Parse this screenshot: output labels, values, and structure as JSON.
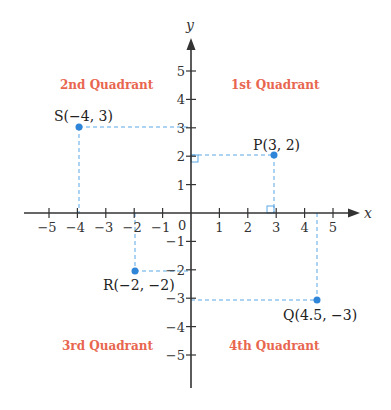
{
  "chart_data": {
    "type": "scatter",
    "title": "",
    "xlabel": "x",
    "ylabel": "y",
    "xlim": [
      -5.5,
      5.5
    ],
    "ylim": [
      -5.5,
      5.5
    ],
    "origin_label": "0",
    "x_ticks": [
      "−5",
      "−4",
      "−3",
      "−2",
      "−1",
      "1",
      "2",
      "3",
      "4",
      "5"
    ],
    "y_ticks": [
      "5",
      "4",
      "3",
      "2",
      "1",
      "−1",
      "−2",
      "−3",
      "−4",
      "−5"
    ],
    "points": [
      {
        "name": "S",
        "x": -4,
        "y": 3,
        "label": "S(−4, 3)"
      },
      {
        "name": "P",
        "x": 3,
        "y": 2,
        "label": "P(3, 2)"
      },
      {
        "name": "R",
        "x": -2,
        "y": -2,
        "label": "R(−2, −2)"
      },
      {
        "name": "Q",
        "x": 4.5,
        "y": -3,
        "label": "Q(4.5, −3)"
      }
    ],
    "quadrants": [
      "1st Quadrant",
      "2nd Quadrant",
      "3rd Quadrant",
      "4th Quadrant"
    ],
    "grid": false
  },
  "colors": {
    "axis": "#333333",
    "point": "#2f86d8",
    "guide": "#5aa7e6",
    "quadrant_text": "#e8664f"
  }
}
